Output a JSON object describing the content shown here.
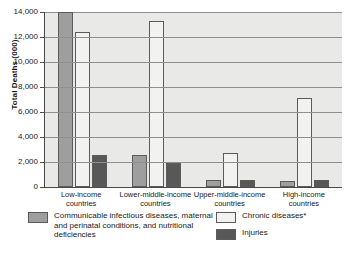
{
  "chart_data": {
    "type": "bar",
    "title": "",
    "xlabel": "",
    "ylabel": "Total Deaths (000)",
    "ylim": [
      0,
      14000
    ],
    "yticks": [
      0,
      2000,
      4000,
      6000,
      8000,
      10000,
      12000,
      14000
    ],
    "ytick_labels": [
      "0",
      "2,000",
      "4,000",
      "6,000",
      "8,000",
      "10,000",
      "12,000",
      "14,000"
    ],
    "grid": true,
    "legend_position": "bottom",
    "categories": [
      "Low-income countries",
      "Lower-middle-income countries",
      "Upper-middle-income countries",
      "High-income countries"
    ],
    "series": [
      {
        "name": "Communicable infectious diseases, maternal and perinatal conditions, and nutritional deficiencies",
        "color": "#9e9e9e",
        "values": [
          14000,
          2600,
          600,
          500
        ]
      },
      {
        "name": "Chronic diseases*",
        "color": "#f2f2f0",
        "values": [
          12400,
          13300,
          2700,
          7100
        ]
      },
      {
        "name": "Injuries",
        "color": "#585858",
        "values": [
          2600,
          1900,
          600,
          600
        ]
      }
    ]
  },
  "axis": {
    "ylabel": "Total Deaths (000)"
  },
  "legend": {
    "items": [
      {
        "label": "Communicable infectious diseases, maternal and perinatal conditions, and nutritional deficiencies",
        "swatch": "s0"
      },
      {
        "label": "Chronic diseases*",
        "swatch": "s1"
      },
      {
        "label": "Injuries",
        "swatch": "s2"
      }
    ]
  },
  "colors": {
    "communicable": "#9e9e9e",
    "chronic": "#f2f2f0",
    "injuries": "#585858",
    "plot_background": "#e9e9e7",
    "gridline": "#8f8f8f",
    "axis": "#4a4a4a"
  }
}
